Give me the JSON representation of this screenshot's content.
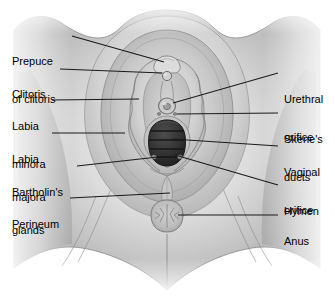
{
  "figure": {
    "width": 335,
    "height": 296,
    "background_color": "#ffffff",
    "leader_line_color": "#1a1a1a",
    "text_color": "#000000"
  },
  "palette": {
    "skin_light": "#f2f2f2",
    "skin_mid": "#c9c9c9",
    "skin_shadow": "#a3a3a3",
    "skin_deep": "#8c8c8c",
    "labia_minora": "#d4d4d4",
    "vestibule": "#bdbdbd",
    "hymen_dark": "#3a3a3a",
    "hymen_ridge": "#262626",
    "outline": "#7a7a7a"
  },
  "labels": {
    "left": [
      {
        "id": "prepuce-of-clitoris",
        "lines": [
          "Prepuce",
          "of clitoris"
        ],
        "text_x": 12,
        "text_y": 30,
        "leader": {
          "x1": 72,
          "y1": 36,
          "x2": 164,
          "y2": 62
        }
      },
      {
        "id": "clitoris",
        "lines": [
          "Clitoris"
        ],
        "text_x": 12,
        "text_y": 63,
        "leader": {
          "x1": 60,
          "y1": 69,
          "x2": 162,
          "y2": 73
        }
      },
      {
        "id": "labia-minora",
        "lines": [
          "Labia",
          "minora"
        ],
        "text_x": 12,
        "text_y": 95,
        "leader": {
          "x1": 52,
          "y1": 100,
          "x2": 139,
          "y2": 99
        }
      },
      {
        "id": "labia-majora",
        "lines": [
          "Labia",
          "majora"
        ],
        "text_x": 12,
        "text_y": 128,
        "leader": {
          "x1": 52,
          "y1": 133,
          "x2": 125,
          "y2": 133
        }
      },
      {
        "id": "bartholins-glands",
        "lines": [
          "Bartholin's",
          "glands"
        ],
        "text_x": 12,
        "text_y": 161,
        "leader": {
          "x1": 77,
          "y1": 166,
          "x2": 158,
          "y2": 157
        }
      },
      {
        "id": "perineum",
        "lines": [
          "Perineum"
        ],
        "text_x": 12,
        "text_y": 193,
        "leader": {
          "x1": 70,
          "y1": 198,
          "x2": 170,
          "y2": 193
        }
      }
    ],
    "right": [
      {
        "id": "urethral-orifice",
        "lines": [
          "Urethral",
          "orifice"
        ],
        "text_x": 284,
        "text_y": 68,
        "leader": {
          "x1": 278,
          "y1": 73,
          "x2": 173,
          "y2": 103
        }
      },
      {
        "id": "skenes-ducts",
        "lines": [
          "Skene's",
          "ducts"
        ],
        "text_x": 284,
        "text_y": 108,
        "leader": {
          "x1": 278,
          "y1": 113,
          "x2": 177,
          "y2": 114
        }
      },
      {
        "id": "vaginal-orifice",
        "lines": [
          "Vaginal",
          "orifice"
        ],
        "text_x": 284,
        "text_y": 141,
        "leader": {
          "x1": 278,
          "y1": 146,
          "x2": 172,
          "y2": 139
        }
      },
      {
        "id": "hymen",
        "lines": [
          "Hymen"
        ],
        "text_x": 284,
        "text_y": 180,
        "leader": {
          "x1": 278,
          "y1": 185,
          "x2": 175,
          "y2": 155
        }
      },
      {
        "id": "anus",
        "lines": [
          "Anus"
        ],
        "text_x": 284,
        "text_y": 210,
        "leader": {
          "x1": 278,
          "y1": 215,
          "x2": 178,
          "y2": 215
        }
      }
    ]
  },
  "structures": [
    {
      "id": "mons-pubis",
      "name": "Mons pubis"
    },
    {
      "id": "prepuce",
      "name": "Prepuce of clitoris"
    },
    {
      "id": "clitoris-glans",
      "name": "Clitoris"
    },
    {
      "id": "labia-minora",
      "name": "Labia minora"
    },
    {
      "id": "labia-majora",
      "name": "Labia majora"
    },
    {
      "id": "urethral-orifice",
      "name": "Urethral orifice"
    },
    {
      "id": "skenes-ducts",
      "name": "Skene's ducts"
    },
    {
      "id": "vestibule",
      "name": "Vestibule"
    },
    {
      "id": "vaginal-orifice",
      "name": "Vaginal orifice"
    },
    {
      "id": "hymen",
      "name": "Hymen"
    },
    {
      "id": "bartholins-glands",
      "name": "Bartholin's glands"
    },
    {
      "id": "perineum",
      "name": "Perineum"
    },
    {
      "id": "anus",
      "name": "Anus"
    },
    {
      "id": "thigh-left",
      "name": "Left inner thigh"
    },
    {
      "id": "thigh-right",
      "name": "Right inner thigh"
    }
  ]
}
